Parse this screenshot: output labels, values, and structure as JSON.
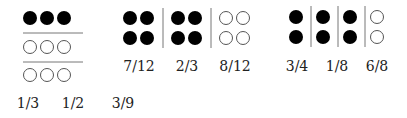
{
  "figures": [
    {
      "id": "left-grid",
      "description": "3x3 grid of dots: top row filled, two rows empty, horizontal dividers",
      "rows": [
        [
          "filled",
          "filled",
          "filled"
        ],
        [
          "empty",
          "empty",
          "empty"
        ],
        [
          "empty",
          "empty",
          "empty"
        ]
      ],
      "labels": [
        "1/3",
        "1/2",
        "3/9"
      ]
    },
    {
      "id": "middle-groups",
      "description": "Three groups of 2x2 dots separated by vertical dividers",
      "groups": [
        [
          [
            "filled",
            "filled"
          ],
          [
            "filled",
            "filled"
          ]
        ],
        [
          [
            "filled",
            "filled"
          ],
          [
            "filled",
            "filled"
          ]
        ],
        [
          [
            "empty",
            "empty"
          ],
          [
            "empty",
            "empty"
          ]
        ]
      ],
      "labels": [
        "7/12",
        "2/3",
        "8/12"
      ]
    },
    {
      "id": "right-groups",
      "description": "Four groups of 1x2 dots separated by vertical dividers",
      "groups": [
        [
          [
            "filled"
          ],
          [
            "filled"
          ]
        ],
        [
          [
            "filled"
          ],
          [
            "filled"
          ]
        ],
        [
          [
            "filled"
          ],
          [
            "filled"
          ]
        ],
        [
          [
            "empty"
          ],
          [
            "empty"
          ]
        ]
      ],
      "labels": [
        "3/4",
        "1/8",
        "6/8"
      ]
    }
  ],
  "colors": {
    "filled": "#000000",
    "stroke": "#555555",
    "divider": "#777777"
  }
}
